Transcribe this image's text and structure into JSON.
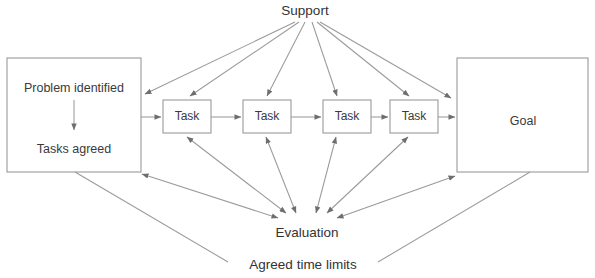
{
  "diagram": {
    "title_text": "Support",
    "nodes": {
      "problem_box": {
        "line1": "Problem identified",
        "line2": "Tasks agreed"
      },
      "tasks": [
        {
          "label": "Task"
        },
        {
          "label": "Task"
        },
        {
          "label": "Task"
        },
        {
          "label": "Task"
        }
      ],
      "goal_box": {
        "label": "Goal"
      },
      "support": {
        "label": "Support"
      },
      "evaluation": {
        "label": "Evaluation"
      },
      "time_limits": {
        "label": "Agreed time limits"
      }
    },
    "colors": {
      "stroke": "#9a9a9a",
      "text": "#3a3a3a",
      "background": "#ffffff"
    }
  }
}
